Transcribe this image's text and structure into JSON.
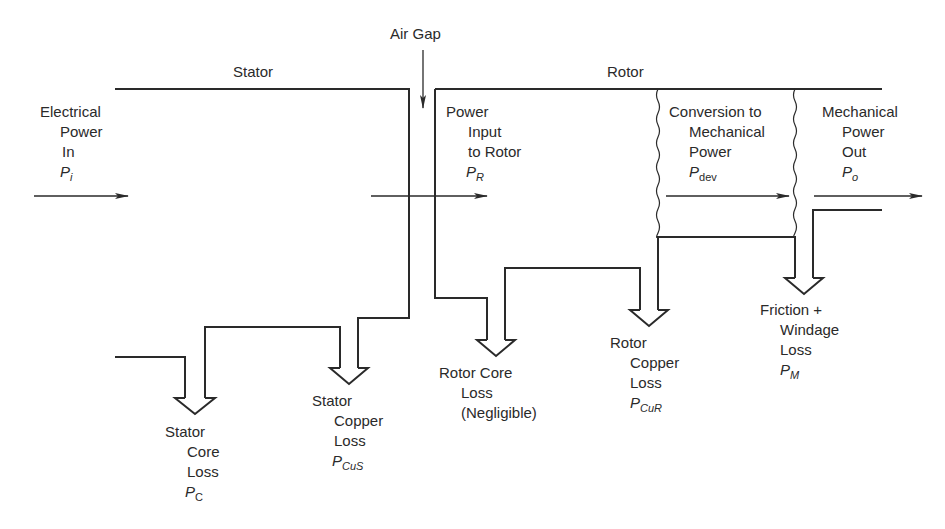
{
  "title_labels": {
    "air_gap": "Air Gap",
    "stator": "Stator",
    "rotor": "Rotor"
  },
  "stages": {
    "electrical_in": {
      "lines": [
        "Electrical",
        "Power",
        "In"
      ],
      "symbol": "P",
      "subscript": "i"
    },
    "rotor_input": {
      "lines": [
        "Power",
        "Input",
        "to Rotor"
      ],
      "symbol": "P",
      "subscript": "R"
    },
    "conversion": {
      "lines": [
        "Conversion to",
        "Mechanical",
        "Power"
      ],
      "symbol": "P",
      "subscript": "dev"
    },
    "mechanical_out": {
      "lines": [
        "Mechanical",
        "Power",
        "Out"
      ],
      "symbol": "P",
      "subscript": "o"
    }
  },
  "losses": {
    "stator_core": {
      "lines": [
        "Stator",
        "Core",
        "Loss"
      ],
      "symbol": "P",
      "subscript": "C"
    },
    "stator_copper": {
      "lines": [
        "Stator",
        "Copper",
        "Loss"
      ],
      "symbol": "P",
      "subscript": "CuS"
    },
    "rotor_core": {
      "lines": [
        "Rotor Core",
        "Loss",
        "(Negligible)"
      ]
    },
    "rotor_copper": {
      "lines": [
        "Rotor",
        "Copper",
        "Loss"
      ],
      "symbol": "P",
      "subscript": "CuR"
    },
    "friction_windage": {
      "lines": [
        "Friction +",
        "Windage",
        "Loss"
      ],
      "symbol": "P",
      "subscript": "M"
    }
  },
  "colors": {
    "line": "#2a2a2a",
    "background": "#ffffff"
  }
}
